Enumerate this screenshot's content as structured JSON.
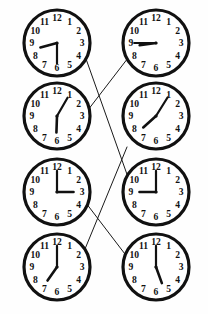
{
  "canvas": {
    "width": 208,
    "height": 314,
    "background": "#fefefe"
  },
  "style": {
    "face_fill": "#ffffff",
    "rim_color": "#111111",
    "hand_color": "#111111",
    "numeral_color": "#111111",
    "line_color": "#1a1a1a",
    "rim_width": 3.2,
    "line_width": 1.0
  },
  "numerals": [
    "12",
    "1",
    "2",
    "3",
    "4",
    "5",
    "6",
    "7",
    "8",
    "9",
    "10",
    "11"
  ],
  "clocks": [
    {
      "id": "clock-1",
      "position": "row1-left",
      "cx": 57,
      "cy": 43,
      "r": 33,
      "time": "8:30",
      "hour_angle": 255,
      "minute_angle": 180,
      "hour_length": 0.52,
      "minute_length": 0.62
    },
    {
      "id": "clock-2",
      "position": "row1-right",
      "cx": 156,
      "cy": 43,
      "r": 33,
      "time": "8:45",
      "hour_angle": 262,
      "minute_angle": 270,
      "hour_length": 0.5,
      "minute_length": 0.66
    },
    {
      "id": "clock-3",
      "position": "row2-left",
      "cx": 57,
      "cy": 116,
      "r": 33,
      "time": "6:05",
      "hour_angle": 182,
      "minute_angle": 30,
      "hour_length": 0.5,
      "minute_length": 0.64
    },
    {
      "id": "clock-4",
      "position": "row2-right",
      "cx": 156,
      "cy": 116,
      "r": 33,
      "time": "7:05",
      "hour_angle": 228,
      "minute_angle": 32,
      "hour_length": 0.52,
      "minute_length": 0.66
    },
    {
      "id": "clock-5",
      "position": "row3-left",
      "cx": 57,
      "cy": 192,
      "r": 33,
      "time": "3:00",
      "hour_angle": 90,
      "minute_angle": 0,
      "hour_length": 0.5,
      "minute_length": 0.64
    },
    {
      "id": "clock-6",
      "position": "row3-right",
      "cx": 156,
      "cy": 192,
      "r": 33,
      "time": "9:00",
      "hour_angle": 270,
      "minute_angle": 0,
      "hour_length": 0.5,
      "minute_length": 0.64
    },
    {
      "id": "clock-7",
      "position": "row4-left",
      "cx": 57,
      "cy": 267,
      "r": 33,
      "time": "7:00",
      "hour_angle": 215,
      "minute_angle": 0,
      "hour_length": 0.5,
      "minute_length": 0.64
    },
    {
      "id": "clock-8",
      "position": "row4-right",
      "cx": 156,
      "cy": 267,
      "r": 33,
      "time": "5:30",
      "hour_angle": 160,
      "minute_angle": 0,
      "hour_length": 0.52,
      "minute_length": 0.64
    }
  ],
  "connections": [
    {
      "id": "link-1",
      "from": "clock-1",
      "to": "clock-6",
      "x1": 85,
      "y1": 56,
      "x2": 129,
      "y2": 180
    },
    {
      "id": "link-2",
      "from": "clock-3",
      "to": "clock-2",
      "x1": 88,
      "y1": 110,
      "x2": 128,
      "y2": 58
    },
    {
      "id": "link-3",
      "from": "clock-5",
      "to": "clock-8",
      "x1": 86,
      "y1": 203,
      "x2": 128,
      "y2": 258
    },
    {
      "id": "link-4",
      "from": "clock-7",
      "to": "clock-4",
      "x1": 85,
      "y1": 249,
      "x2": 127,
      "y2": 147
    }
  ]
}
